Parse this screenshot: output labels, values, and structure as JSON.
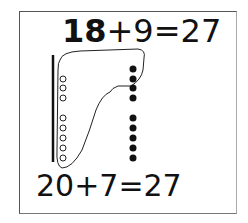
{
  "worksheet": {
    "top_equation": {
      "first_addend": "18",
      "operator": "+",
      "second_addend": "9",
      "equals": "=",
      "result": "27"
    },
    "bottom_equation": {
      "text": "20+7=27"
    },
    "model": {
      "ten_bar": "vertical line representing ten",
      "hollow_circles": 8,
      "hollow_groups": [
        3,
        5
      ],
      "filled_dots": 9,
      "filled_groups": [
        4,
        5
      ],
      "grouping_loop": "curve grouping 8 hollow circles with 2 filled dots to make a ten"
    },
    "colors": {
      "ink": "#111111",
      "border": "#555555",
      "background": "#ffffff"
    }
  }
}
